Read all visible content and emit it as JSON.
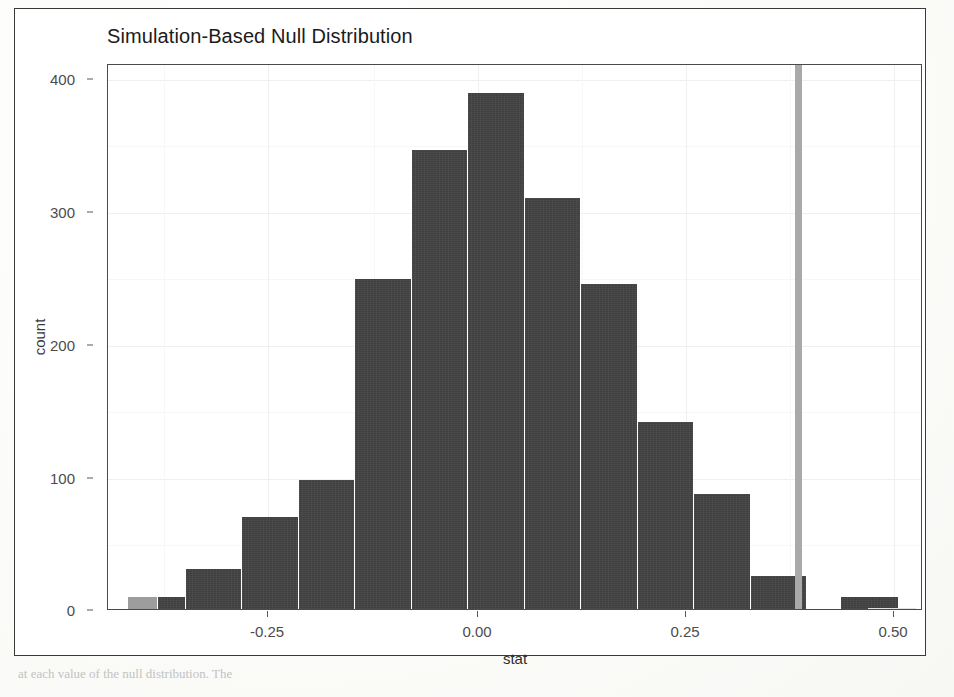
{
  "figure": {
    "title": "Simulation-Based Null Distribution",
    "caption_bleed": "at each value of the null distribution. The"
  },
  "chart_data": {
    "type": "bar",
    "title": "Simulation-Based Null Distribution",
    "xlabel": "stat",
    "ylabel": "count",
    "xlim": [
      -0.44,
      0.56
    ],
    "ylim": [
      0,
      412
    ],
    "grid": true,
    "legend": "none",
    "bin_width": 0.0695,
    "categories": [
      "-0.41",
      "-0.34",
      "-0.27",
      "-0.20",
      "-0.13",
      "-0.07",
      "0.00",
      "0.07",
      "0.14",
      "0.20",
      "0.27",
      "0.34",
      "0.41"
    ],
    "bin_centers": [
      -0.3805,
      -0.311,
      -0.2415,
      -0.172,
      -0.1025,
      -0.033,
      0.0365,
      0.106,
      0.1755,
      0.245,
      0.3145,
      0.384
    ],
    "bin_edges": [
      -0.415,
      -0.3455,
      -0.276,
      -0.2065,
      -0.137,
      -0.0675,
      0.002,
      0.0715,
      0.141,
      0.2105,
      0.28,
      0.3495,
      0.419
    ],
    "values": [
      9,
      30,
      70,
      98,
      250,
      348,
      391,
      311,
      246,
      142,
      87,
      25,
      9
    ],
    "y_ticks": [
      0,
      100,
      200,
      300,
      400
    ],
    "y_tick_labels": [
      "0",
      "100",
      "200",
      "300",
      "400"
    ],
    "x_ticks": [
      -0.25,
      0.0,
      0.25,
      0.5
    ],
    "x_tick_labels": [
      "-0.25",
      "0.00",
      "0.25",
      "0.50"
    ],
    "annotations": [
      {
        "name": "observed-statistic-line",
        "type": "vline",
        "x": 0.409,
        "color": "#a9a9a9",
        "label": ""
      }
    ],
    "bar_color": "#3f3f3f",
    "panel_background": "#ffffff",
    "gridline_color": "#efefef"
  },
  "axes": {
    "y_title": "count",
    "x_title": "stat",
    "y_tick_labels": [
      "400",
      "300",
      "200",
      "100",
      "0"
    ],
    "x_tick_labels": [
      "-0.25",
      "0.00",
      "0.25",
      "0.50"
    ]
  }
}
